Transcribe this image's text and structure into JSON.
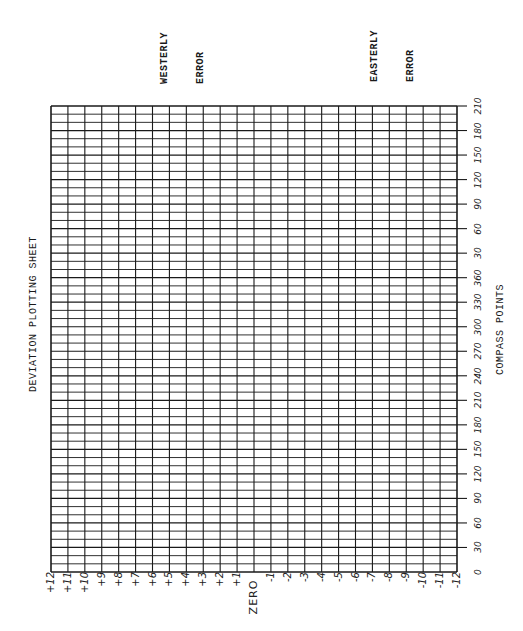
{
  "chart_data": {
    "type": "table",
    "title": "DEVIATION PLOTTING SHEET",
    "orientation": "rotated -90deg (landscape sheet printed sideways)",
    "xlabel": "COMPASS POINTS",
    "ylabel": "",
    "annotations": [
      "WESTERLY ERROR",
      "EASTERLY ERROR"
    ],
    "compass_axis": {
      "label": "COMPASS POINTS",
      "ticks": [
        0,
        30,
        60,
        90,
        120,
        150,
        180,
        210,
        240,
        270,
        300,
        330,
        360,
        30,
        60,
        90,
        120,
        150,
        180,
        210
      ],
      "minor_divisions_per_tick": 3,
      "range_degrees": [
        0,
        570
      ]
    },
    "deviation_axis": {
      "ticks": [
        "+12",
        "+11",
        "+10",
        "+9",
        "+8",
        "+7",
        "+6",
        "+5",
        "+4",
        "+3",
        "+2",
        "+1",
        "ZERO",
        "-1",
        "-2",
        "-3",
        "-4",
        "-5",
        "-6",
        "-7",
        "-8",
        "-9",
        "-10",
        "-11",
        "-12"
      ],
      "range": [
        12,
        -12
      ],
      "westerly_side": "positive",
      "easterly_side": "negative"
    },
    "grid": true,
    "series": []
  },
  "sheet": {
    "title": "DEVIATION PLOTTING SHEET",
    "westerly_line1": "WESTERLY",
    "westerly_line2": "ERROR",
    "easterly_line1": "EASTERLY",
    "easterly_line2": "ERROR",
    "compass_axis_label": "COMPASS POINTS",
    "line_color": "#1a1a1a",
    "paper_color": "#ffffff"
  }
}
